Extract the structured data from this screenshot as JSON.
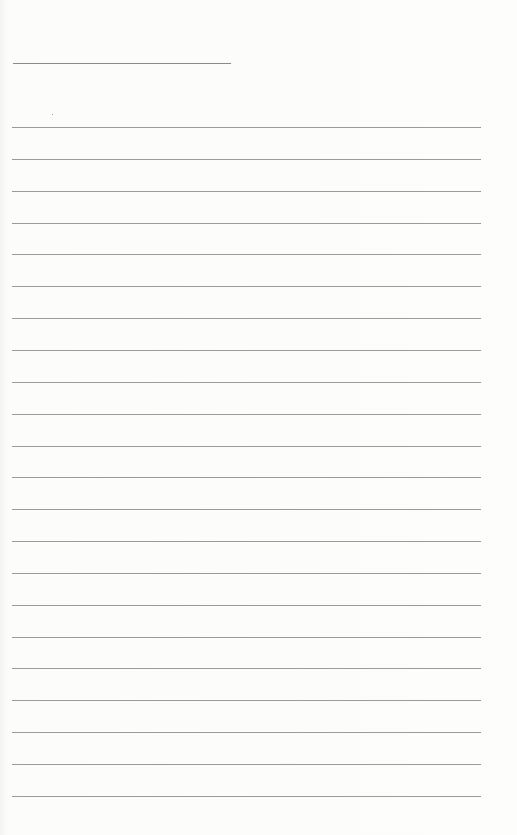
{
  "page": {
    "type": "lined-notepaper",
    "title_line": {
      "x": 13,
      "y": 63,
      "width": 218
    },
    "ruled_lines": {
      "count": 22,
      "first_y": 127,
      "spacing": 31.85,
      "x": 12,
      "width": 469
    },
    "colors": {
      "paper": "#fcfcfb",
      "rule": "#9a9a9a",
      "title_rule": "#8a8a8a"
    }
  }
}
